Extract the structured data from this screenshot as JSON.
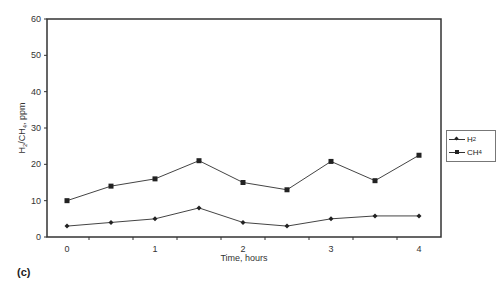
{
  "chart_data": {
    "type": "line",
    "title": "",
    "xlabel": "Time, hours",
    "ylabel": "H2/CH4, ppm",
    "x": [
      0,
      0.5,
      1,
      1.5,
      2,
      2.5,
      3,
      3.5,
      4
    ],
    "x_ticks": [
      "0",
      "1",
      "2",
      "3",
      "4"
    ],
    "y_ticks": [
      "0",
      "10",
      "20",
      "30",
      "40",
      "50",
      "60"
    ],
    "ylim": [
      0,
      60
    ],
    "xlim": [
      -0.25,
      4.25
    ],
    "grid": false,
    "legend_position": "right",
    "series": [
      {
        "name": "H2",
        "marker": "diamond",
        "values": [
          3,
          4,
          5,
          8,
          4,
          3,
          5,
          5.8,
          5.8
        ]
      },
      {
        "name": "CH4",
        "marker": "square",
        "values": [
          10,
          14,
          16,
          21,
          15,
          13,
          20.8,
          15.5,
          22.5
        ]
      }
    ]
  },
  "labels": {
    "xlabel": "Time, hours",
    "ylabel_main": "H",
    "ylabel_sub1": "2",
    "ylabel_mid": "/CH",
    "ylabel_sub2": "4",
    "ylabel_end": ", ppm",
    "panel": "(c)",
    "legend_h2": "H",
    "legend_h2_sub": "2",
    "legend_ch4": "CH",
    "legend_ch4_sub": "4"
  }
}
